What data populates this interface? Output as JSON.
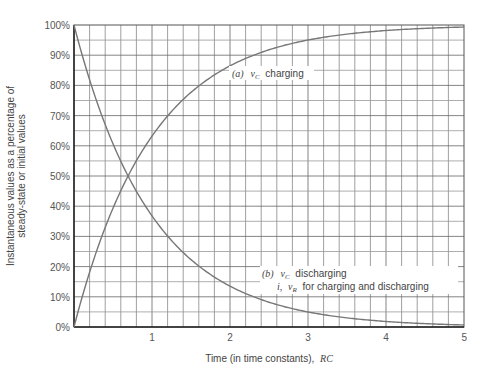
{
  "chart_data": {
    "type": "line",
    "title": "",
    "xlabel": "Time (in time constants), RC",
    "xlabel_text": "Time (in time constants),",
    "xlabel_var": "RC",
    "ylabel": "Instantaneous values as a percentage of steady-state or initial values",
    "ylabel_line1": "Instantaneous values as a percentage of",
    "ylabel_line2": "steady-state or initial values",
    "xlim": [
      0,
      5
    ],
    "ylim": [
      0,
      100
    ],
    "x_ticks": [
      "1",
      "2",
      "3",
      "4",
      "5"
    ],
    "y_ticks": [
      "0%",
      "10%",
      "20%",
      "30%",
      "40%",
      "50%",
      "60%",
      "70%",
      "80%",
      "90%",
      "100%"
    ],
    "grid": true,
    "x": [
      0,
      0.5,
      1,
      1.5,
      2,
      2.5,
      3,
      3.5,
      4,
      4.5,
      5
    ],
    "series": [
      {
        "name": "(a) vC charging",
        "values": [
          0,
          39.3,
          63.2,
          77.7,
          86.5,
          91.8,
          95.0,
          97.0,
          98.2,
          98.9,
          99.3
        ]
      },
      {
        "name": "(b) vC discharging; i, vR for charging and discharging",
        "values": [
          100,
          60.7,
          36.8,
          22.3,
          13.5,
          8.2,
          5.0,
          3.0,
          1.8,
          1.1,
          0.7
        ]
      }
    ],
    "annotations": [
      {
        "id": "a",
        "prefix": "(a)",
        "var": "v",
        "sub": "C",
        "text": "charging"
      },
      {
        "id": "b1",
        "prefix": "(b)",
        "var": "v",
        "sub": "C",
        "text": "discharging"
      },
      {
        "id": "b2",
        "var1": "i,",
        "var": "v",
        "sub": "R",
        "text": "for charging and discharging"
      }
    ]
  }
}
